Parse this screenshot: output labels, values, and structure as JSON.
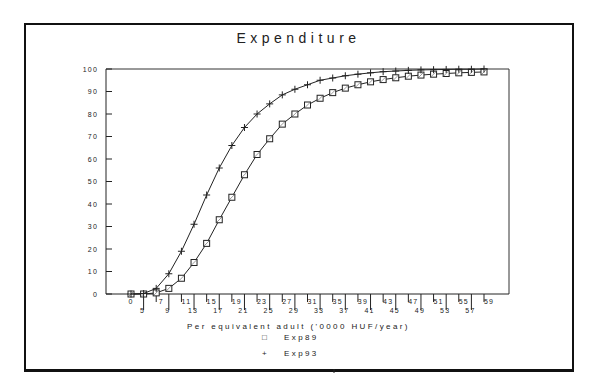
{
  "chart_data": {
    "type": "line",
    "title": "Expenditure",
    "xlabel": "Per equivalent adult ('0000 HUF/year)",
    "ylabel": "",
    "ylim": [
      0,
      100
    ],
    "yticks": [
      0,
      10,
      20,
      30,
      40,
      50,
      60,
      70,
      80,
      90,
      100
    ],
    "grid": false,
    "legend_position": "bottom-center",
    "categories": [
      "0",
      "5",
      "7",
      "9",
      "11",
      "13",
      "15",
      "17",
      "19",
      "21",
      "23",
      "25",
      "27",
      "29",
      "31",
      "33",
      "35",
      "37",
      "39",
      "41",
      "43",
      "45",
      "47",
      "49",
      "51",
      "53",
      "55",
      "57",
      "59"
    ],
    "series": [
      {
        "name": "Exp89",
        "marker": "square",
        "values": [
          0,
          0,
          0.5,
          2.5,
          7,
          14,
          22.5,
          33,
          43,
          53,
          62,
          69,
          75.5,
          80,
          84,
          87,
          89.5,
          91.5,
          93,
          94.3,
          95.3,
          96.1,
          96.8,
          97.3,
          97.7,
          98,
          98.3,
          98.5,
          98.7
        ]
      },
      {
        "name": "Exp93",
        "marker": "plus",
        "values": [
          0,
          0.2,
          2.5,
          9,
          19,
          31,
          44,
          56,
          66,
          74,
          80,
          84.5,
          88.5,
          91,
          93,
          95,
          96,
          97,
          97.7,
          98.3,
          98.8,
          99.1,
          99.4,
          99.6,
          99.7,
          99.8,
          99.9,
          99.9,
          100
        ]
      }
    ]
  },
  "legend": {
    "items": [
      {
        "symbol": "□",
        "label": "Exp89"
      },
      {
        "symbol": "+",
        "label": "Exp93"
      }
    ]
  }
}
